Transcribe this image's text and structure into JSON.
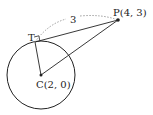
{
  "diagram": {
    "points": {
      "P": {
        "label": "P(4, 3)",
        "x": 118,
        "y": 20
      },
      "C": {
        "label": "C(2, 0)",
        "x": 41,
        "y": 75
      },
      "T": {
        "label": "T",
        "x": 35,
        "y": 42
      }
    },
    "circle": {
      "cx": 41,
      "cy": 75,
      "r": 34
    },
    "segment_length_label": "3",
    "colors": {
      "stroke": "#222222",
      "dashed": "#888888"
    }
  }
}
